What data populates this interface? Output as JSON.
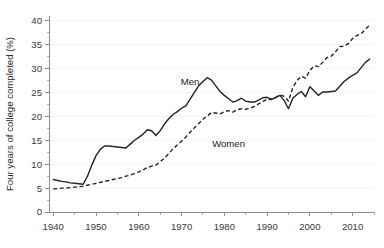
{
  "chart_data": {
    "type": "line",
    "title": "",
    "subtitle": "",
    "xlabel": "",
    "ylabel": "Four years of college completed (%)",
    "xlim": [
      1939,
      2015
    ],
    "ylim": [
      0,
      41
    ],
    "xticks": [
      1940,
      1950,
      1960,
      1970,
      1980,
      1990,
      2000,
      2010
    ],
    "xtick_labels": [
      "1940",
      "1950",
      "1960",
      "1970",
      "1980",
      "1990",
      "2000",
      "2010"
    ],
    "yticks": [
      0,
      5,
      10,
      15,
      20,
      25,
      30,
      35,
      40
    ],
    "ytick_labels": [
      "0",
      "5",
      "10",
      "15",
      "20",
      "25",
      "30",
      "35",
      "40"
    ],
    "grid": "horizontal-major-faint",
    "legend_position": "inline-annotations",
    "annotations": [
      {
        "text": "Men",
        "x": 1972,
        "y": 26.5
      },
      {
        "text": "Women",
        "x": 1981,
        "y": 13.5
      }
    ],
    "series": [
      {
        "name": "Men",
        "style": "solid",
        "color": "#242424",
        "x": [
          1940,
          1941,
          1942,
          1943,
          1944,
          1945,
          1946,
          1947,
          1948,
          1949,
          1950,
          1951,
          1952,
          1953,
          1954,
          1955,
          1956,
          1957,
          1958,
          1959,
          1960,
          1961,
          1962,
          1963,
          1964,
          1965,
          1966,
          1967,
          1968,
          1969,
          1970,
          1971,
          1972,
          1973,
          1974,
          1975,
          1976,
          1977,
          1978,
          1979,
          1980,
          1981,
          1982,
          1983,
          1984,
          1985,
          1986,
          1987,
          1988,
          1989,
          1990,
          1991,
          1992,
          1993,
          1994,
          1995,
          1996,
          1997,
          1998,
          1999,
          2000,
          2001,
          2002,
          2003,
          2004,
          2005,
          2006,
          2007,
          2008,
          2009,
          2010,
          2011,
          2012,
          2013,
          2014
        ],
        "y": [
          6.8,
          6.6,
          6.4,
          6.3,
          6.1,
          6.0,
          5.9,
          5.8,
          7.5,
          9.8,
          11.8,
          13.1,
          13.8,
          13.8,
          13.7,
          13.6,
          13.5,
          13.4,
          14.2,
          15.0,
          15.6,
          16.3,
          17.2,
          17.0,
          16.0,
          17.0,
          18.4,
          19.5,
          20.4,
          21.0,
          21.7,
          22.2,
          23.6,
          25.0,
          26.4,
          27.3,
          28.1,
          27.6,
          26.4,
          25.2,
          24.4,
          23.7,
          23.0,
          23.3,
          23.8,
          23.2,
          23.0,
          23.0,
          23.4,
          23.9,
          24.0,
          23.6,
          23.9,
          24.4,
          23.3,
          21.6,
          23.8,
          24.6,
          25.2,
          24.1,
          26.2,
          25.3,
          24.4,
          25.1,
          25.1,
          25.2,
          25.3,
          26.3,
          27.3,
          28.0,
          28.6,
          29.1,
          30.2,
          31.3,
          32.0
        ]
      },
      {
        "name": "Women",
        "style": "dashed",
        "color": "#242424",
        "x": [
          1940,
          1941,
          1942,
          1943,
          1944,
          1945,
          1946,
          1947,
          1948,
          1949,
          1950,
          1951,
          1952,
          1953,
          1954,
          1955,
          1956,
          1957,
          1958,
          1959,
          1960,
          1961,
          1962,
          1963,
          1964,
          1965,
          1966,
          1967,
          1968,
          1969,
          1970,
          1971,
          1972,
          1973,
          1974,
          1975,
          1976,
          1977,
          1978,
          1979,
          1980,
          1981,
          1982,
          1983,
          1984,
          1985,
          1986,
          1987,
          1988,
          1989,
          1990,
          1991,
          1992,
          1993,
          1994,
          1995,
          1996,
          1997,
          1998,
          1999,
          2000,
          2001,
          2002,
          2003,
          2004,
          2005,
          2006,
          2007,
          2008,
          2009,
          2010,
          2011,
          2012,
          2013,
          2014
        ],
        "y": [
          4.8,
          4.9,
          5.0,
          5.0,
          5.1,
          5.2,
          5.3,
          5.4,
          5.6,
          5.8,
          6.0,
          6.2,
          6.4,
          6.6,
          6.8,
          7.0,
          7.2,
          7.5,
          7.7,
          8.1,
          8.4,
          8.8,
          9.3,
          9.6,
          9.8,
          10.5,
          11.3,
          12.2,
          13.2,
          14.0,
          14.8,
          15.7,
          16.7,
          17.6,
          18.5,
          19.4,
          20.1,
          20.8,
          20.7,
          20.5,
          21.0,
          21.2,
          20.9,
          21.4,
          21.6,
          21.5,
          21.7,
          22.1,
          22.6,
          23.1,
          23.6,
          23.5,
          24.0,
          24.5,
          24.2,
          23.2,
          26.0,
          27.5,
          28.4,
          28.0,
          29.6,
          30.6,
          30.4,
          31.3,
          32.3,
          32.6,
          33.5,
          34.6,
          34.7,
          35.2,
          36.3,
          36.9,
          37.3,
          38.2,
          39.1
        ]
      }
    ]
  }
}
